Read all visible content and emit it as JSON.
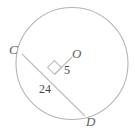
{
  "figure": {
    "type": "circle-geometry-diagram",
    "background_color": "#ffffff",
    "stroke_color": "#b0b0b0",
    "label_color": "#5e5e5e",
    "number_color": "#4a4a4a"
  },
  "circle": {
    "name": "circle-O",
    "center_x": 72,
    "center_y": 63.5,
    "radius": 56
  },
  "chord": {
    "name": "chord-CD",
    "x1": 22,
    "y1": 54,
    "x2": 85,
    "y2": 116
  },
  "radius_segment": {
    "name": "segment-O-to-chord",
    "x1": 72,
    "y1": 57,
    "x2": 54.5,
    "y2": 74.5
  },
  "right_angle": {
    "name": "right-angle-mark",
    "points": "47.5,67.5 54.5,74.5 61.5,67.5 54.5,60.5"
  },
  "labels": {
    "point_c": "C",
    "point_o": "O",
    "point_d": "D",
    "radius_length": "5",
    "chord_half_length": "24"
  }
}
